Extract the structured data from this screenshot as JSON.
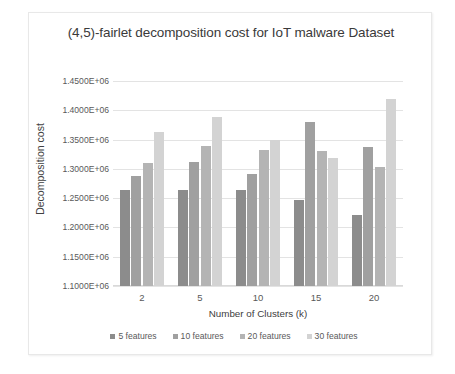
{
  "chart_data": {
    "type": "bar",
    "title": "(4,5)-fairlet decomposition cost for IoT malware Dataset",
    "xlabel": "Number of Clusters (k)",
    "ylabel": "Decomposition cost",
    "categories": [
      "2",
      "5",
      "10",
      "15",
      "20"
    ],
    "ylim": [
      1100000,
      1450000
    ],
    "ytick_labels": [
      "1.4500E+06",
      "1.4000E+06",
      "1.3500E+06",
      "1.3000E+06",
      "1.2500E+06",
      "1.2000E+06",
      "1.1500E+06",
      "1.1000E+06"
    ],
    "ytick_values": [
      1450000,
      1400000,
      1350000,
      1300000,
      1250000,
      1200000,
      1150000,
      1100000
    ],
    "grid": true,
    "legend_position": "bottom",
    "series": [
      {
        "name": "5 features",
        "color": "#8c8c8c",
        "values": [
          1264000,
          1264000,
          1264000,
          1247000,
          1221000
        ]
      },
      {
        "name": "10 features",
        "color": "#a0a0a0",
        "values": [
          1287000,
          1312000,
          1292000,
          1380000,
          1338000
        ]
      },
      {
        "name": "20 features",
        "color": "#b4b4b4",
        "values": [
          1310000,
          1339000,
          1333000,
          1331000,
          1303000
        ]
      },
      {
        "name": "30 features",
        "color": "#d3d3d3",
        "values": [
          1363000,
          1388000,
          1350000,
          1318000,
          1420000
        ]
      }
    ]
  }
}
